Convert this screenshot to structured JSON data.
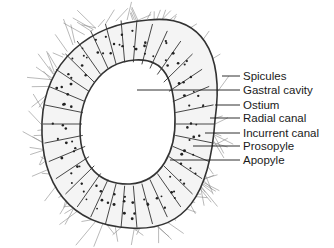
{
  "diagram": {
    "colors": {
      "ink": "#1a1a1a",
      "background": "#ffffff",
      "spicule": "#888888"
    },
    "labels": [
      {
        "text": "Spicules",
        "y": 76,
        "line_from_x": 222
      },
      {
        "text": "Gastral cavity",
        "y": 90,
        "line_from_x": 137
      },
      {
        "text": "Ostium",
        "y": 105,
        "line_from_x": 215
      },
      {
        "text": "Radial canal",
        "y": 118,
        "line_from_x": 210
      },
      {
        "text": "Incurrent canal",
        "y": 133,
        "line_from_x": 205
      },
      {
        "text": "Prosopyle",
        "y": 146,
        "line_from_x": 193
      },
      {
        "text": "Apopyle",
        "y": 160,
        "line_from_x": 170
      }
    ]
  }
}
